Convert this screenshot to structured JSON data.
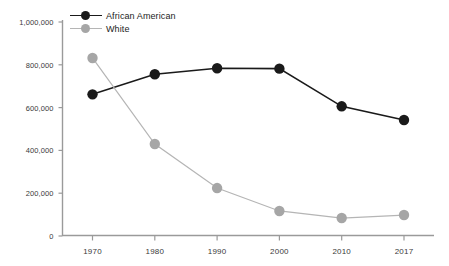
{
  "chart_data": {
    "type": "line",
    "title": "",
    "subtitle": "",
    "xlabel": "",
    "ylabel": "",
    "categories": [
      "1970",
      "1980",
      "1990",
      "2000",
      "2010",
      "2017"
    ],
    "x": [
      1970,
      1980,
      1990,
      2000,
      2010,
      2017
    ],
    "series": [
      {
        "name": "African American",
        "color": "#1a1a1a",
        "values": [
          662000,
          756000,
          784000,
          782000,
          606000,
          542000
        ]
      },
      {
        "name": "White",
        "color": "#a6a6a6",
        "values": [
          832000,
          430000,
          224000,
          117000,
          84000,
          98000
        ]
      }
    ],
    "ylim": [
      0,
      1000000
    ],
    "yticks": [
      0,
      200000,
      400000,
      600000,
      800000,
      1000000
    ],
    "ytick_labels": [
      "0",
      "200,000",
      "400,000",
      "600,000",
      "800,000",
      "1,000,000"
    ],
    "xtick_labels": [
      "1970",
      "1980",
      "1990",
      "2000",
      "2010",
      "2017"
    ],
    "grid": false,
    "legend_position": "top-left",
    "axis_color": "#9a9a9a"
  },
  "legend": {
    "items": [
      {
        "label": "African American",
        "color": "#1a1a1a"
      },
      {
        "label": "White",
        "color": "#a6a6a6"
      }
    ]
  }
}
